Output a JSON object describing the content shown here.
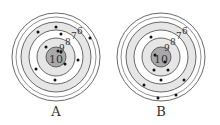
{
  "targets": [
    {
      "label": "A",
      "center": [
        56,
        57
      ],
      "ring_scores": [
        "10",
        "9",
        "8",
        "7",
        "6"
      ],
      "ring_radii": [
        10,
        19,
        27,
        35,
        44
      ],
      "shots": [
        [
          56,
          27
        ],
        [
          38,
          32
        ],
        [
          61,
          34
        ],
        [
          90,
          38
        ],
        [
          46,
          47
        ],
        [
          61,
          52
        ],
        [
          58,
          51
        ],
        [
          78,
          60
        ],
        [
          65,
          64
        ],
        [
          36,
          69
        ],
        [
          55,
          80
        ]
      ]
    },
    {
      "label": "B",
      "center": [
        161,
        57
      ],
      "ring_scores": [
        "10",
        "9",
        "8",
        "7",
        "6"
      ],
      "ring_radii": [
        10,
        19,
        27,
        35,
        44
      ],
      "shots": [
        [
          151,
          37
        ],
        [
          155,
          55
        ],
        [
          165,
          62
        ],
        [
          154,
          70
        ],
        [
          168,
          70
        ],
        [
          161,
          80
        ],
        [
          184,
          80
        ],
        [
          144,
          85
        ],
        [
          176,
          95
        ],
        [
          158,
          98
        ]
      ]
    }
  ],
  "colors": {
    "bullseye": "#a9a9a9",
    "band_light": "#e6e6e6",
    "band_white": "#ffffff",
    "stroke": "#444444"
  }
}
